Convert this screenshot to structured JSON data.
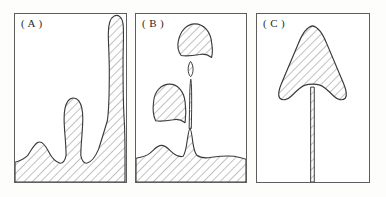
{
  "figure": {
    "background_color": "#ffffff",
    "ink_color": "#3a3a3a",
    "hatch_color": "#6b6b6b",
    "frame_color": "#5d5d5d",
    "panel_count": 3
  },
  "panels": [
    {
      "id": "a",
      "label": "( A )",
      "description": "Hatched base layer with three rounded protrusions; tallest is a bulb-tipped spike reaching the top of the frame",
      "features": [
        {
          "name": "small-bump",
          "kind": "bump",
          "height_fraction": 0.18
        },
        {
          "name": "medium-stalk",
          "kind": "stalk",
          "height_fraction": 0.56
        },
        {
          "name": "tall-spike",
          "kind": "spike",
          "height_fraction": 0.93
        }
      ]
    },
    {
      "id": "b",
      "label": "( B )",
      "description": "Hatched base layer with a sharp cusp and a thin tapering stem; two detached droplets and one tiny satellite droplet float above",
      "features": [
        {
          "name": "small-bump",
          "kind": "bump",
          "height_fraction": 0.12
        },
        {
          "name": "cusp-peak",
          "kind": "cusp",
          "height_fraction": 0.3
        },
        {
          "name": "thin-stem",
          "kind": "stem",
          "height_fraction": 0.62
        },
        {
          "name": "satellite-droplet",
          "kind": "droplet",
          "height_fraction": 0.7
        },
        {
          "name": "upper-detached-droplet",
          "kind": "droplet",
          "height_fraction": 0.92
        },
        {
          "name": "left-detached-droplet",
          "kind": "droplet",
          "height_fraction": 0.62
        }
      ]
    },
    {
      "id": "c",
      "label": "( C )",
      "description": "Single hatched arrowhead-shaped cap with flared wings and a deep notch, mounted on a long thin vertical stem running to the bottom of the frame",
      "features": [
        {
          "name": "arrowhead-cap",
          "kind": "cap",
          "height_fraction": 0.95
        },
        {
          "name": "long-stem",
          "kind": "stem",
          "height_fraction": 0.55
        }
      ]
    }
  ]
}
